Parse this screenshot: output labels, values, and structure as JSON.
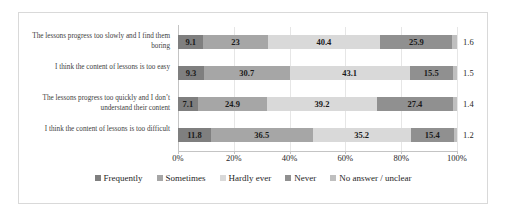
{
  "chart_data": {
    "type": "bar",
    "orientation": "horizontal",
    "stacked": true,
    "normalized_percent": true,
    "title": "",
    "xlabel": "",
    "ylabel": "",
    "xlim": [
      0,
      100
    ],
    "grid": true,
    "legend_position": "bottom",
    "xticks": [
      "0%",
      "20%",
      "40%",
      "60%",
      "80%",
      "100%"
    ],
    "xtick_values": [
      0,
      20,
      40,
      60,
      80,
      100
    ],
    "categories": [
      "The lessons progress too slowly and I find them boring",
      "I think the content of lessons is too easy",
      "The lessons progress too quickly and I don’t understand their content",
      "I think the content of lessons is too difficult"
    ],
    "series": [
      {
        "name": "Frequently",
        "color": "#7f7f7f",
        "values": [
          9.1,
          9.3,
          7.1,
          11.8
        ]
      },
      {
        "name": "Sometimes",
        "color": "#a6a6a6",
        "values": [
          23,
          30.7,
          24.9,
          36.5
        ]
      },
      {
        "name": "Hardly ever",
        "color": "#d9d9d9",
        "values": [
          40.4,
          43.1,
          39.2,
          35.2
        ]
      },
      {
        "name": "Never",
        "color": "#909090",
        "values": [
          25.9,
          15.5,
          27.4,
          15.4
        ]
      },
      {
        "name": "No answer / unclear",
        "color": "#bfbfbf",
        "values": [
          1.6,
          1.5,
          1.4,
          1.2
        ]
      }
    ],
    "rows": [
      {
        "label": "The lessons progress too slowly and I find them boring",
        "segments": [
          {
            "series": "Frequently",
            "value": 9.1,
            "label": "9.1"
          },
          {
            "series": "Sometimes",
            "value": 23,
            "label": "23"
          },
          {
            "series": "Hardly ever",
            "value": 40.4,
            "label": "40.4"
          },
          {
            "series": "Never",
            "value": 25.9,
            "label": "25.9"
          },
          {
            "series": "No answer / unclear",
            "value": 1.6,
            "label": ""
          }
        ],
        "outside_label": "1.6"
      },
      {
        "label": "I think the content of lessons is too easy",
        "segments": [
          {
            "series": "Frequently",
            "value": 9.3,
            "label": "9.3"
          },
          {
            "series": "Sometimes",
            "value": 30.7,
            "label": "30.7"
          },
          {
            "series": "Hardly ever",
            "value": 43.1,
            "label": "43.1"
          },
          {
            "series": "Never",
            "value": 15.5,
            "label": "15.5"
          },
          {
            "series": "No answer / unclear",
            "value": 1.5,
            "label": ""
          }
        ],
        "outside_label": "1.5"
      },
      {
        "label": "The lessons progress too quickly and I don’t understand their content",
        "segments": [
          {
            "series": "Frequently",
            "value": 7.1,
            "label": "7.1"
          },
          {
            "series": "Sometimes",
            "value": 24.9,
            "label": "24.9"
          },
          {
            "series": "Hardly ever",
            "value": 39.2,
            "label": "39.2"
          },
          {
            "series": "Never",
            "value": 27.4,
            "label": "27.4"
          },
          {
            "series": "No answer / unclear",
            "value": 1.4,
            "label": ""
          }
        ],
        "outside_label": "1.4"
      },
      {
        "label": "I think the content of lessons is too difficult",
        "segments": [
          {
            "series": "Frequently",
            "value": 11.8,
            "label": "11.8"
          },
          {
            "series": "Sometimes",
            "value": 36.5,
            "label": "36.5"
          },
          {
            "series": "Hardly ever",
            "value": 35.2,
            "label": "35.2"
          },
          {
            "series": "Never",
            "value": 15.4,
            "label": "15.4"
          },
          {
            "series": "No answer / unclear",
            "value": 1.2,
            "label": ""
          }
        ],
        "outside_label": "1.2"
      }
    ]
  },
  "legend": {
    "items": [
      {
        "label": "Frequently",
        "color": "#7f7f7f"
      },
      {
        "label": "Sometimes",
        "color": "#a6a6a6"
      },
      {
        "label": "Hardly ever",
        "color": "#d9d9d9"
      },
      {
        "label": "Never",
        "color": "#909090"
      },
      {
        "label": "No answer / unclear",
        "color": "#bfbfbf"
      }
    ]
  }
}
